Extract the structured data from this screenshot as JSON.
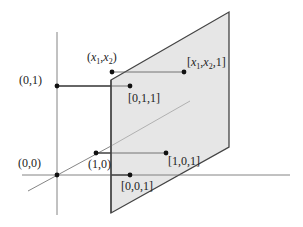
{
  "diagram": {
    "colors": {
      "plane_fill": "#e6e6e6",
      "plane_stroke": "#444444",
      "axis": "#666666",
      "connector": "#333333",
      "point": "#111111",
      "text": "#222222"
    },
    "plane": {
      "points": "111,80 229,12 229,147 111,213"
    },
    "axes": {
      "vertical": {
        "x1": 57,
        "y1": 32,
        "x2": 57,
        "y2": 215
      },
      "horizontal": {
        "x1": 22,
        "y1": 175,
        "x2": 290,
        "y2": 175
      },
      "diagonal_outside": {
        "x1": 28,
        "y1": 191,
        "x2": 111,
        "y2": 146
      },
      "diagonal_inside": {
        "x1": 111,
        "y1": 146,
        "x2": 190,
        "y2": 101
      }
    },
    "connectors": [
      {
        "name": "x1x2-connector",
        "x1": 112,
        "y1": 72,
        "x2": 184,
        "y2": 72
      },
      {
        "name": "01-connector",
        "x1": 57,
        "y1": 86,
        "x2": 130,
        "y2": 86
      },
      {
        "name": "10-connector",
        "x1": 96,
        "y1": 153,
        "x2": 166,
        "y2": 153
      },
      {
        "name": "00-connector",
        "x1": 57,
        "y1": 175,
        "x2": 130,
        "y2": 175
      }
    ],
    "points": [
      {
        "name": "point-x1x2",
        "cx": 112,
        "cy": 72
      },
      {
        "name": "point-x1x2-1",
        "cx": 184,
        "cy": 72
      },
      {
        "name": "point-0-1",
        "cx": 57,
        "cy": 86
      },
      {
        "name": "point-0-1-1",
        "cx": 130,
        "cy": 86
      },
      {
        "name": "point-1-0",
        "cx": 96,
        "cy": 153
      },
      {
        "name": "point-1-0-1",
        "cx": 166,
        "cy": 153
      },
      {
        "name": "point-0-0",
        "cx": 57,
        "cy": 175
      },
      {
        "name": "point-0-0-1",
        "cx": 130,
        "cy": 175
      }
    ],
    "labels": {
      "x1x2_open": "(",
      "x1x2_x": "x",
      "x1x2_sub1": "1",
      "x1x2_comma": ",",
      "x1x2_x2": "x",
      "x1x2_sub2": "2",
      "x1x2_close": ")",
      "x1x2_1_open": "[",
      "x1x2_1_x": "x",
      "x1x2_1_sub1": "1",
      "x1x2_1_comma": ",",
      "x1x2_1_x2": "x",
      "x1x2_1_sub2": "2",
      "x1x2_1_tail": ",1]",
      "p01": "(0,1)",
      "p011": "[0,1,1]",
      "p00": "(0,0)",
      "p10": "(1,0)",
      "p101": "[1,0,1]",
      "p001": "[0,0,1]"
    }
  }
}
